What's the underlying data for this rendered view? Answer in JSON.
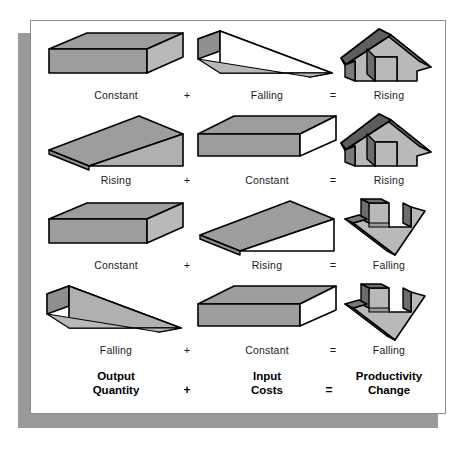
{
  "figure": {
    "title_hidden": "",
    "colors": {
      "panel_background": "#ffffff",
      "panel_border": "#8d8d8d",
      "shadow": "#9a9a9a",
      "shape_outline": "#000000",
      "gray_mid": "#9d9d9d",
      "gray_light": "#bdbdbd",
      "gray_dark": "#5e5e5e",
      "white_face": "#ffffff",
      "label_text": "#1a1a1a",
      "footer_text": "#000000"
    },
    "operators": {
      "plus": "+",
      "equals": "="
    },
    "rows": [
      {
        "output": {
          "label": "Constant",
          "shape": "box-gray-front"
        },
        "input": {
          "label": "Falling",
          "shape": "wedge-falling"
        },
        "result": {
          "label": "Rising",
          "shape": "arrow-up"
        }
      },
      {
        "output": {
          "label": "Rising",
          "shape": "wedge-rising"
        },
        "input": {
          "label": "Constant",
          "shape": "box-white-front"
        },
        "result": {
          "label": "Rising",
          "shape": "arrow-up"
        }
      },
      {
        "output": {
          "label": "Constant",
          "shape": "box-gray-front"
        },
        "input": {
          "label": "Rising",
          "shape": "wedge-rising"
        },
        "result": {
          "label": "Falling",
          "shape": "arrow-down"
        }
      },
      {
        "output": {
          "label": "Falling",
          "shape": "wedge-falling"
        },
        "input": {
          "label": "Constant",
          "shape": "box-white-front"
        },
        "result": {
          "label": "Falling",
          "shape": "arrow-down"
        }
      }
    ],
    "footer": {
      "output_line1": "Output",
      "output_line2": "Quantity",
      "input_line1": "Input",
      "input_line2": "Costs",
      "result_line1": "Productivity",
      "result_line2": "Change",
      "plus": "+",
      "equals": "="
    }
  }
}
